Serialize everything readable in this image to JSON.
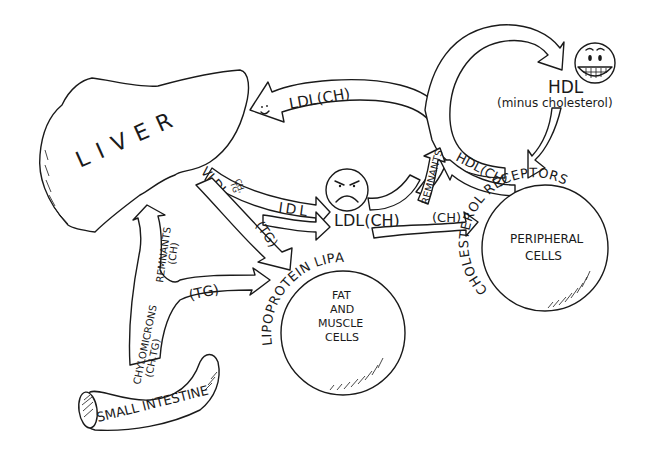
{
  "diagram": {
    "colors": {
      "ink": "#1a1a1a",
      "paper": "#ffffff"
    },
    "organs": {
      "liver": "LIVER",
      "small_intestine": "SMALL INTESTINE",
      "fat_muscle": [
        "FAT",
        "AND",
        "MUSCLE",
        "CELLS"
      ],
      "peripheral": [
        "PERIPHERAL",
        "CELLS"
      ]
    },
    "ring_labels": {
      "lipoprotein_lipase": "LIPOPROTEIN LIPASE",
      "cholesterol_receptors": "CHOLESTEROL RECEPTORS"
    },
    "arrows": {
      "ldl_to_liver": "LDL(CH)",
      "vldl": "VLDL",
      "vldl_sub_top": "CH,",
      "vldl_sub_bottom": "TG",
      "idl": "IDL",
      "tg_vldl": "(TG)",
      "ldl_node": "LDL(CH)",
      "ch_to_peripheral": "(CH)",
      "remnants_ldl": "REMNANTS",
      "hdl_ch": "HDL(CH)",
      "hdl_title": "HDL",
      "hdl_sub": "(minus cholesterol)",
      "chylomicrons": "CHYLOMICRONS",
      "chylomicrons_sub": "(CH,TG)",
      "remnants_chylo": "REMNANTS",
      "remnants_chylo_sub": "(CH)",
      "tg_chylo": "(TG)"
    },
    "faces": {
      "ldl_arrow_face": "smiling-face",
      "ldl_face": "angry-face",
      "hdl_face": "grinning-face"
    }
  }
}
